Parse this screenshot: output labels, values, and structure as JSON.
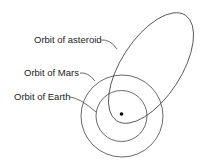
{
  "diagram": {
    "labels": {
      "asteroid": "Orbit of asteroid",
      "mars": "Orbit of Mars",
      "earth": "Orbit of Earth"
    },
    "colors": {
      "line": "#444444",
      "text": "#222222",
      "sun": "#000000",
      "background": "#ffffff"
    }
  }
}
